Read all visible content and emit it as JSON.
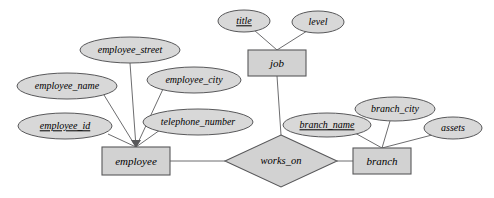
{
  "diagram": {
    "type": "entity-relationship-diagram",
    "title": "",
    "background_color": "#ffffff",
    "shape_fill_color": "#d2d2d2",
    "attribute_fill_color": "#d8d8d8",
    "stroke_color": "#58585a",
    "entities": [
      {
        "id": "employee",
        "label": "employee",
        "shape": "rectangle",
        "x": 102,
        "y": 147,
        "width": 68,
        "height": 28,
        "attributes": [
          {
            "id": "employee_street",
            "label": "employee_street",
            "key": false,
            "cx": 130,
            "cy": 50,
            "rx": 50,
            "ry": 13
          },
          {
            "id": "employee_name",
            "label": "employee_name",
            "key": false,
            "cx": 67,
            "cy": 86,
            "rx": 50,
            "ry": 13
          },
          {
            "id": "employee_city",
            "label": "employee_city",
            "key": false,
            "cx": 194,
            "cy": 80,
            "rx": 47,
            "ry": 13
          },
          {
            "id": "employee_id",
            "label": "employee_id",
            "key": true,
            "cx": 65,
            "cy": 126,
            "rx": 47,
            "ry": 13
          },
          {
            "id": "telephone_number",
            "label": "telephone_number",
            "key": false,
            "cx": 198,
            "cy": 122,
            "rx": 55,
            "ry": 13
          }
        ]
      },
      {
        "id": "job",
        "label": "job",
        "shape": "rectangle",
        "x": 248,
        "y": 50,
        "width": 58,
        "height": 26,
        "attributes": [
          {
            "id": "title",
            "label": "title",
            "key": true,
            "cx": 244,
            "cy": 21,
            "rx": 26,
            "ry": 11
          },
          {
            "id": "level",
            "label": "level",
            "key": false,
            "cx": 318,
            "cy": 22,
            "rx": 26,
            "ry": 11
          }
        ]
      },
      {
        "id": "branch",
        "label": "branch",
        "shape": "rectangle",
        "x": 353,
        "y": 148,
        "width": 58,
        "height": 26,
        "attributes": [
          {
            "id": "branch_name",
            "label": "branch_name",
            "key": true,
            "cx": 327,
            "cy": 125,
            "rx": 44,
            "ry": 12
          },
          {
            "id": "branch_city",
            "label": "branch_city",
            "key": false,
            "cx": 395,
            "cy": 109,
            "rx": 40,
            "ry": 12
          },
          {
            "id": "assets",
            "label": "assets",
            "key": false,
            "cx": 453,
            "cy": 128,
            "rx": 29,
            "ry": 11
          }
        ]
      }
    ],
    "relationships": [
      {
        "id": "works_on",
        "label": "works_on",
        "shape": "diamond",
        "cx": 281,
        "cy": 161,
        "half_width": 56,
        "half_height": 26,
        "connects": [
          "employee",
          "branch",
          "job"
        ]
      }
    ],
    "connections": [
      {
        "from": "employee_street",
        "to": "employee",
        "style": "line"
      },
      {
        "from": "employee_name",
        "to": "employee",
        "style": "line"
      },
      {
        "from": "employee_city",
        "to": "employee",
        "style": "line"
      },
      {
        "from": "employee_id",
        "to": "employee",
        "style": "line"
      },
      {
        "from": "telephone_number",
        "to": "employee",
        "style": "line"
      },
      {
        "from": "title",
        "to": "job",
        "style": "line"
      },
      {
        "from": "level",
        "to": "job",
        "style": "line"
      },
      {
        "from": "branch_name",
        "to": "branch",
        "style": "line"
      },
      {
        "from": "branch_city",
        "to": "branch",
        "style": "line"
      },
      {
        "from": "assets",
        "to": "branch",
        "style": "line"
      },
      {
        "from": "employee",
        "to": "works_on",
        "style": "line"
      },
      {
        "from": "branch",
        "to": "works_on",
        "style": "line"
      },
      {
        "from": "job",
        "to": "works_on",
        "style": "line"
      }
    ]
  }
}
